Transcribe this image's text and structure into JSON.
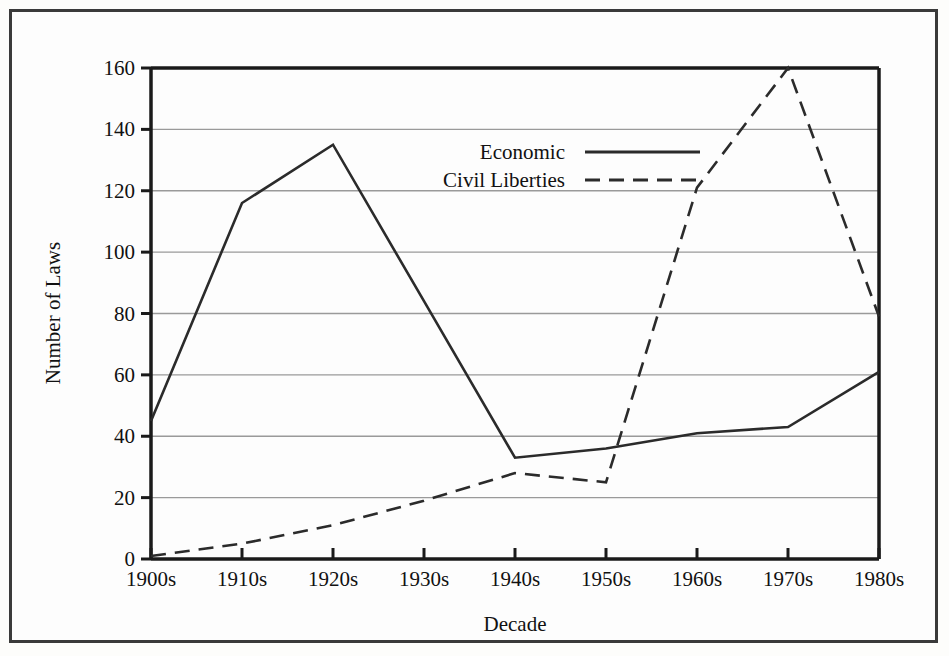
{
  "chart_data": {
    "type": "line",
    "title": "",
    "xlabel": "Decade",
    "ylabel": "Number of Laws",
    "categories": [
      "1900s",
      "1910s",
      "1920s",
      "1930s",
      "1940s",
      "1950s",
      "1960s",
      "1970s",
      "1980s"
    ],
    "series": [
      {
        "name": "Economic",
        "style": "solid",
        "values": [
          45,
          116,
          135,
          84,
          33,
          36,
          41,
          43,
          61
        ]
      },
      {
        "name": "Civil Liberties",
        "style": "dashed",
        "values": [
          1,
          5,
          11,
          19,
          28,
          25,
          121,
          160,
          79
        ]
      }
    ],
    "ylim": [
      0,
      160
    ],
    "yticks": [
      0,
      20,
      40,
      60,
      80,
      100,
      120,
      140,
      160
    ],
    "grid": "horizontal",
    "legend_position": "upper-center",
    "colors": {
      "line": "#2b2b2b",
      "grid": "#9a9a9a",
      "axis": "#1a1a1a",
      "frame": "#3a3a3a",
      "background": "#fdfdfd"
    }
  },
  "axes": {
    "y_tick_labels": [
      "0",
      "20",
      "40",
      "60",
      "80",
      "100",
      "120",
      "140",
      "160"
    ],
    "x_tick_labels": [
      "1900s",
      "1910s",
      "1920s",
      "1930s",
      "1940s",
      "1950s",
      "1960s",
      "1970s",
      "1980s"
    ],
    "y_title": "Number of Laws",
    "x_title": "Decade"
  },
  "legend": {
    "items": [
      {
        "label": "Economic",
        "style": "solid"
      },
      {
        "label": "Civil Liberties",
        "style": "dashed"
      }
    ]
  }
}
